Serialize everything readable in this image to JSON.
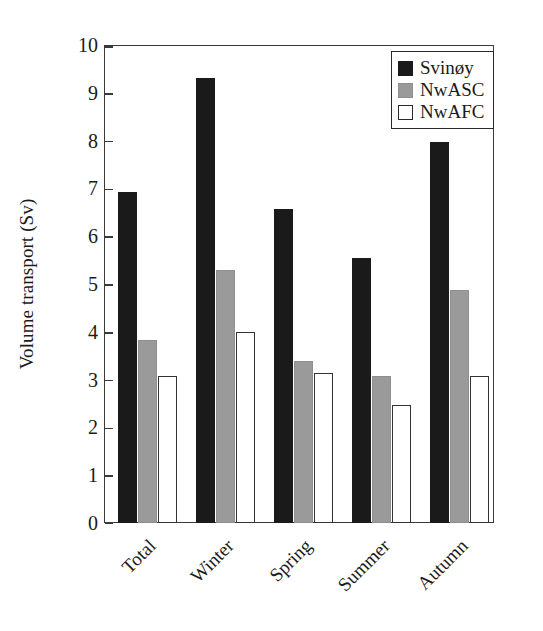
{
  "chart_data": {
    "type": "bar",
    "title": "",
    "xlabel": "",
    "ylabel": "Volume transport (Sv)",
    "categories": [
      "Total",
      "Winter",
      "Spring",
      "Summer",
      "Autumn"
    ],
    "series": [
      {
        "name": "Svinøy",
        "color": "#1a1a1a",
        "values": [
          6.93,
          9.32,
          6.56,
          5.54,
          7.98
        ]
      },
      {
        "name": "NwASC",
        "color": "#9a9a9a",
        "values": [
          3.83,
          5.3,
          3.38,
          3.07,
          4.87
        ]
      },
      {
        "name": "NwAFC",
        "color": "#ffffff",
        "values": [
          3.07,
          4.0,
          3.13,
          2.46,
          3.08
        ]
      }
    ],
    "ylim": [
      0,
      10
    ],
    "ytick_labels": [
      "0",
      "1",
      "2",
      "3",
      "4",
      "5",
      "6",
      "7",
      "8",
      "9",
      "10"
    ],
    "ytick_values": [
      0,
      1,
      2,
      3,
      4,
      5,
      6,
      7,
      8,
      9,
      10
    ],
    "grid": false,
    "legend_position": "top-right",
    "xtick_rotation_deg": -45
  },
  "axis": {
    "y_title": "Volume transport (Sv)"
  },
  "legend": {
    "entries": [
      {
        "label": "Svinøy"
      },
      {
        "label": "NwASC"
      },
      {
        "label": "NwAFC"
      }
    ]
  }
}
